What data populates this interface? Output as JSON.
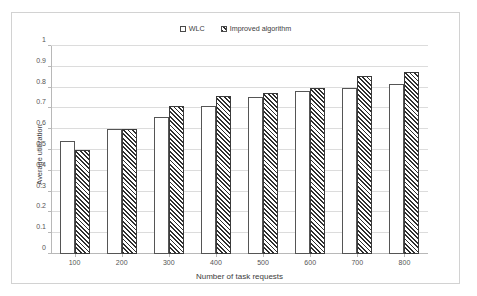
{
  "chart_data": {
    "type": "bar",
    "title": "",
    "xlabel": "Number of task requests",
    "ylabel": "Average utilization",
    "categories": [
      "100",
      "200",
      "300",
      "400",
      "500",
      "600",
      "700",
      "800"
    ],
    "series": [
      {
        "name": "WLC",
        "pattern": "dots",
        "values": [
          0.545,
          0.6,
          0.66,
          0.71,
          0.755,
          0.785,
          0.8,
          0.815
        ]
      },
      {
        "name": "Improved algorithm",
        "pattern": "diagonal-hatch",
        "values": [
          0.5,
          0.6,
          0.71,
          0.76,
          0.775,
          0.8,
          0.855,
          0.875
        ]
      }
    ],
    "ylim": [
      0,
      1
    ],
    "ytick_labels": [
      "0",
      "0.1",
      "0.2",
      "0.3",
      "0.4",
      "0.5",
      "0.6",
      "0.7",
      "0.8",
      "0.9",
      "1"
    ],
    "ytick_values": [
      0,
      0.1,
      0.2,
      0.3,
      0.4,
      0.5,
      0.6,
      0.7,
      0.8,
      0.9,
      1
    ],
    "grid": true,
    "legend_position": "top-center",
    "colors": {
      "gridline": "#dcdcdc",
      "axis": "#b8b8b8",
      "border": "#d2d2d2",
      "series_a_ink": "#6e6e6e",
      "series_b_ink": "#2f2f2f",
      "background": "#ffffff"
    }
  }
}
